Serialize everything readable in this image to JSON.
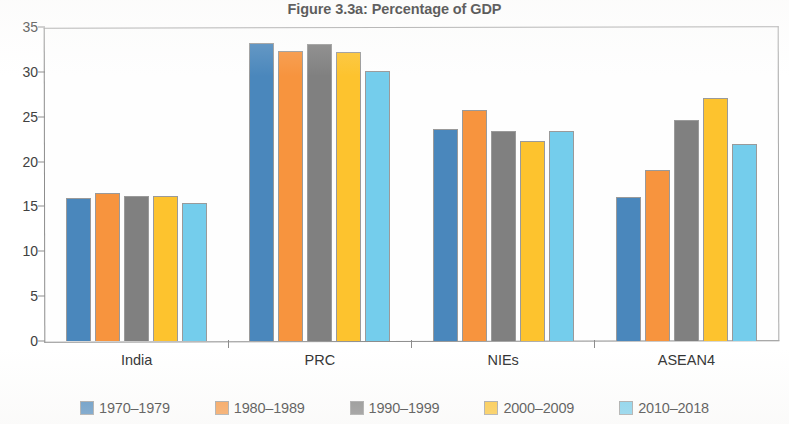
{
  "chart_data": {
    "type": "bar",
    "title": "Figure 3.3a: Percentage of GDP",
    "xlabel": "",
    "ylabel": "",
    "ylim": [
      0,
      35
    ],
    "yticks": [
      0,
      5,
      10,
      15,
      20,
      25,
      30,
      35
    ],
    "ytick_labels": [
      "0",
      "5",
      "10",
      "15",
      "20",
      "25",
      "30",
      "35"
    ],
    "grid": false,
    "legend_position": "bottom",
    "categories": [
      "India",
      "PRC",
      "NIEs",
      "ASEAN4"
    ],
    "series": [
      {
        "name": "1970–1979",
        "color": "#4a87bc",
        "values": [
          15.9,
          33.2,
          23.6,
          16.0
        ]
      },
      {
        "name": "1980–1989",
        "color": "#f7943e",
        "values": [
          16.5,
          32.3,
          25.8,
          19.1
        ]
      },
      {
        "name": "1990–1999",
        "color": "#808080",
        "values": [
          16.2,
          33.1,
          23.4,
          24.6
        ]
      },
      {
        "name": "2000–2009",
        "color": "#fdc32e",
        "values": [
          16.2,
          32.2,
          22.3,
          27.1
        ]
      },
      {
        "name": "2010–2018",
        "color": "#74cdec",
        "values": [
          15.4,
          30.1,
          23.4,
          22.0
        ]
      }
    ]
  }
}
